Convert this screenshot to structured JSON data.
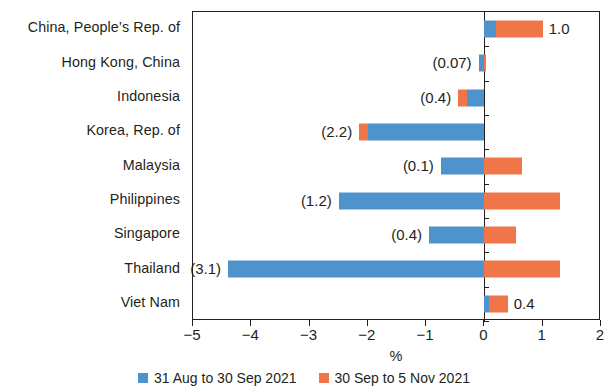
{
  "chart_data": {
    "type": "bar",
    "orientation": "horizontal",
    "stacked": true,
    "title": "",
    "subtitle": "",
    "xlabel": "%",
    "ylabel": "",
    "xlim": [
      -5,
      2
    ],
    "xticks": [
      -5,
      -4,
      -3,
      -2,
      -1,
      0,
      1,
      2
    ],
    "xtick_labels": [
      "−5",
      "−4",
      "−3",
      "−2",
      "−1",
      "0",
      "1",
      "2"
    ],
    "grid": false,
    "legend_position": "bottom",
    "categories": [
      "China, People’s Rep. of",
      "Hong Kong, China",
      "Indonesia",
      "Korea, Rep. of",
      "Malaysia",
      "Philippines",
      "Singapore",
      "Thailand",
      "Viet Nam"
    ],
    "series": [
      {
        "name": "31 Aug to 30 Sep 2021",
        "color": "#4f93cd",
        "values": [
          0.2,
          -0.1,
          -0.3,
          -2.0,
          -0.75,
          -2.5,
          -0.95,
          -4.4,
          0.08
        ]
      },
      {
        "name": "30 Sep to 5 Nov 2021",
        "color": "#f0764a",
        "values": [
          0.8,
          0.03,
          -0.15,
          -0.15,
          0.65,
          1.3,
          0.55,
          1.3,
          0.32
        ]
      }
    ],
    "data_labels": [
      "1.0",
      "(0.07)",
      "(0.4)",
      "(2.2)",
      "(0.1)",
      "(1.2)",
      "(0.4)",
      "(3.1)",
      "0.4"
    ],
    "data_label_side": [
      "right",
      "left",
      "left",
      "left",
      "left",
      "left",
      "left",
      "left",
      "right"
    ],
    "annotations": []
  },
  "legend": {
    "items": [
      {
        "label": "31 Aug to 30 Sep 2021",
        "color": "#4f93cd"
      },
      {
        "label": "30 Sep to 5 Nov 2021",
        "color": "#f0764a"
      }
    ]
  },
  "colors": {
    "series_blue": "#4f93cd",
    "series_orange": "#f0764a",
    "axis": "#231f20",
    "background": "#ffffff"
  }
}
